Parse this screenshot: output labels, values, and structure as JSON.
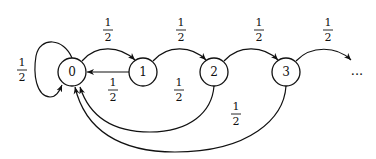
{
  "diagram": {
    "type": "markov-chain",
    "nodes": [
      {
        "id": "0",
        "label": "0"
      },
      {
        "id": "1",
        "label": "1"
      },
      {
        "id": "2",
        "label": "2"
      },
      {
        "id": "3",
        "label": "3"
      }
    ],
    "continuation": "...",
    "edges": [
      {
        "from": "0",
        "to": "0",
        "prob_num": "1",
        "prob_den": "2"
      },
      {
        "from": "0",
        "to": "1",
        "prob_num": "1",
        "prob_den": "2"
      },
      {
        "from": "1",
        "to": "0",
        "prob_num": "1",
        "prob_den": "2"
      },
      {
        "from": "1",
        "to": "2",
        "prob_num": "1",
        "prob_den": "2"
      },
      {
        "from": "2",
        "to": "0",
        "prob_num": "1",
        "prob_den": "2"
      },
      {
        "from": "2",
        "to": "3",
        "prob_num": "1",
        "prob_den": "2"
      },
      {
        "from": "3",
        "to": "0",
        "prob_num": "1",
        "prob_den": "2"
      },
      {
        "from": "3",
        "to": "...",
        "prob_num": "1",
        "prob_den": "2"
      }
    ]
  }
}
